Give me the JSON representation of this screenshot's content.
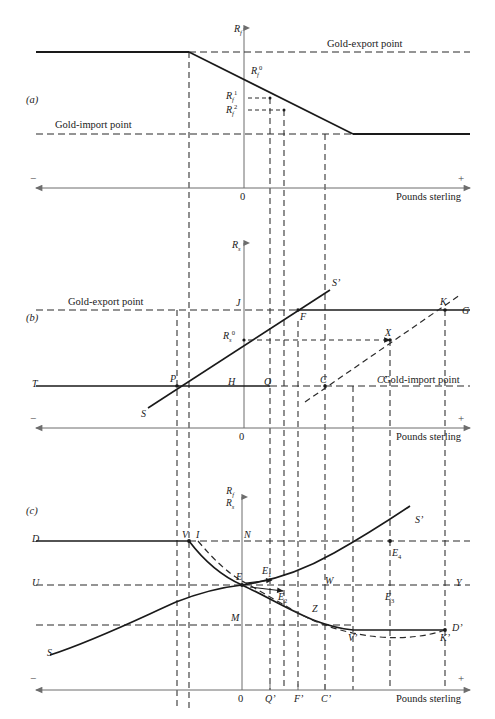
{
  "figure": {
    "axis_x_label": "Pounds sterling",
    "plus_sign": "+",
    "minus_sign": "−",
    "origin_label": "0"
  },
  "panels": [
    {
      "id": "a",
      "tag": "(a)",
      "y_axis_label": "R",
      "y_axis_sub": "f",
      "lines": [
        {
          "name": "gold-export-point",
          "label": "Gold-export point",
          "style": "dashed-horizontal"
        },
        {
          "name": "gold-import-point",
          "label": "Gold-import point",
          "style": "dashed-horizontal"
        },
        {
          "name": "rf-schedule",
          "label": "",
          "style": "solid-downward"
        }
      ],
      "value_labels": [
        {
          "name": "rf0",
          "base": "R",
          "sub": "f",
          "sup": "0"
        },
        {
          "name": "rf1",
          "base": "R",
          "sub": "f",
          "sup": "1"
        },
        {
          "name": "rf2",
          "base": "R",
          "sub": "f",
          "sup": "2"
        }
      ]
    },
    {
      "id": "b",
      "tag": "(b)",
      "y_axis_label": "R",
      "y_axis_sub": "s",
      "lines": [
        {
          "name": "gold-export-point",
          "label": "Gold-export point",
          "style": "dashed-horizontal"
        },
        {
          "name": "gold-import-point",
          "label": "Gold-import point",
          "style": "dashed-horizontal"
        },
        {
          "name": "ss-schedule",
          "label": "S’",
          "style": "solid-upward"
        },
        {
          "name": "shifted-schedule",
          "label": "",
          "style": "dashed-upward"
        }
      ],
      "point_labels": [
        "T",
        "S",
        "P",
        "H",
        "Q",
        "C",
        "C’",
        "J",
        "F",
        "K",
        "G",
        "X",
        "S’"
      ],
      "value_labels": [
        {
          "name": "rs0",
          "base": "R",
          "sub": "s",
          "sup": "0"
        }
      ]
    },
    {
      "id": "c",
      "tag": "(c)",
      "y_axis_numerator": "R",
      "y_axis_numerator_sub": "f",
      "y_axis_denominator": "R",
      "y_axis_denominator_sub": "s",
      "lines": [
        {
          "name": "demand-curve",
          "label": "D",
          "style": "solid-curve"
        },
        {
          "name": "supply-curve",
          "label": "S",
          "style": "solid-curve"
        },
        {
          "name": "supply-curve-end",
          "label": "S’",
          "style": "solid-curve"
        },
        {
          "name": "demand-curve-end",
          "label": "D’",
          "style": "solid-curve"
        },
        {
          "name": "shifted-demand",
          "label": "",
          "style": "dashed-curve"
        }
      ],
      "point_labels": [
        "D",
        "S",
        "U",
        "M",
        "V",
        "I",
        "N",
        "E",
        "S’",
        "D’",
        "Y",
        "W",
        "Z",
        "V’",
        "K’"
      ],
      "equilibria": [
        {
          "name": "E1",
          "base": "E",
          "sub": "1"
        },
        {
          "name": "E2",
          "base": "E",
          "sub": "2"
        },
        {
          "name": "E3",
          "base": "E",
          "sub": "3"
        },
        {
          "name": "E4",
          "base": "E",
          "sub": "4"
        }
      ],
      "x_tick_labels": [
        "0",
        "Q’",
        "F’",
        "C’"
      ]
    }
  ],
  "colors": {
    "ink": "#1a1a1a",
    "axis": "#6d6d6d",
    "dash": "#2b2b2b",
    "background": "#ffffff"
  }
}
